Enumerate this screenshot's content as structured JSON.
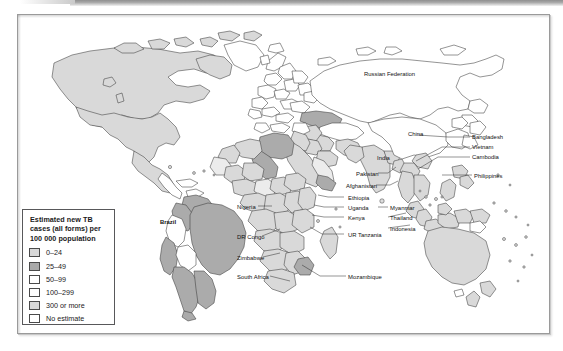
{
  "figure": {
    "type": "choropleth-world-map",
    "subject": "Estimated new TB cases (all forms) per 100 000 population"
  },
  "legend": {
    "title_line1": "Estimated new TB",
    "title_line2": "cases (all forms) per",
    "title_line3": "100 000 population",
    "items": [
      {
        "label": "0–24",
        "color": "#d8d8d8"
      },
      {
        "label": "25–49",
        "color": "#a9a9a9"
      },
      {
        "label": "50–99",
        "color": "#ffffff"
      },
      {
        "label": "100–299",
        "color": "#fdfdfd"
      },
      {
        "label": "300 or more",
        "color": "#d8d8d8"
      },
      {
        "label": "No estimate",
        "color": "#ffffff"
      }
    ]
  },
  "map_labels": [
    {
      "name": "brazil",
      "text": "Brazil",
      "x": 142,
      "y": 204,
      "bold": true
    },
    {
      "name": "russian-federation",
      "text": "Russian Federation",
      "x": 346,
      "y": 56,
      "bold": false
    },
    {
      "name": "china",
      "text": "China",
      "x": 390,
      "y": 116,
      "bold": false
    },
    {
      "name": "india",
      "text": "India",
      "x": 359,
      "y": 140,
      "bold": false
    },
    {
      "name": "bangladesh",
      "text": "Bangladesh",
      "x": 454,
      "y": 119,
      "bold": false
    },
    {
      "name": "vietnam",
      "text": "Vietnam",
      "x": 454,
      "y": 129,
      "bold": false
    },
    {
      "name": "cambodia",
      "text": "Cambodia",
      "x": 454,
      "y": 139,
      "bold": false
    },
    {
      "name": "philippines",
      "text": "Philippines",
      "x": 456,
      "y": 158,
      "bold": false
    },
    {
      "name": "pakistan",
      "text": "Pakistan",
      "x": 338,
      "y": 156,
      "bold": false
    },
    {
      "name": "afghanistan",
      "text": "Afghanistan",
      "x": 328,
      "y": 168,
      "bold": false
    },
    {
      "name": "ethiopia",
      "text": "Ethiopia",
      "x": 330,
      "y": 180,
      "bold": false
    },
    {
      "name": "uganda",
      "text": "Uganda",
      "x": 330,
      "y": 190,
      "bold": false
    },
    {
      "name": "kenya",
      "text": "Kenya",
      "x": 330,
      "y": 200,
      "bold": false
    },
    {
      "name": "ur-tanzania",
      "text": "UR Tanzania",
      "x": 330,
      "y": 217,
      "bold": false
    },
    {
      "name": "nigeria",
      "text": "Nigeria",
      "x": 219,
      "y": 189,
      "bold": false
    },
    {
      "name": "dr-congo",
      "text": "DR Congo",
      "x": 219,
      "y": 219,
      "bold": false
    },
    {
      "name": "zimbabwe",
      "text": "Zimbabwe",
      "x": 219,
      "y": 240,
      "bold": false
    },
    {
      "name": "south-africa",
      "text": "South Africa",
      "x": 219,
      "y": 259,
      "bold": false
    },
    {
      "name": "mozambique",
      "text": "Mozambique",
      "x": 330,
      "y": 259,
      "bold": false
    },
    {
      "name": "myanmar",
      "text": "Myanmar",
      "x": 372,
      "y": 190,
      "bold": false
    },
    {
      "name": "thailand",
      "text": "Thailand",
      "x": 372,
      "y": 200,
      "bold": false
    },
    {
      "name": "indonesia",
      "text": "Indonesia",
      "x": 372,
      "y": 211,
      "bold": false
    }
  ]
}
